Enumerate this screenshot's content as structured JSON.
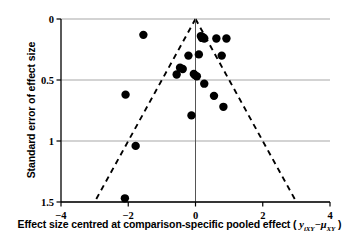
{
  "chart_data": {
    "type": "scatter",
    "title": "",
    "subtitle": "",
    "xlabel_plain": "Effect size centred at comparison-specific pooled effect ( y iXY − μ XY )",
    "xlabel_prefix": "Effect size centred at comparison-specific pooled effect ( ",
    "xlabel_var1": "y",
    "xlabel_sub1": "iXY",
    "xlabel_minus": "−",
    "xlabel_var2": "μ",
    "xlabel_sub2": "XY",
    "xlabel_suffix": " )",
    "ylabel": "Standard error of effect size",
    "xlim": [
      -4,
      4
    ],
    "ylim": [
      0,
      1.5
    ],
    "y_inverted": true,
    "xticks": [
      -4,
      -2,
      0,
      2,
      4
    ],
    "xticklabels": [
      "−4",
      "−2",
      "0",
      "2",
      "4"
    ],
    "yticks": [
      0,
      0.5,
      1,
      1.5
    ],
    "yticklabels": [
      "0",
      "0.5",
      "1",
      "1.5"
    ],
    "grid": "horizontal",
    "grid_color": "#a8a8a8",
    "legend": "none",
    "marker_color": "#000000",
    "marker_size": 4.2,
    "reference_line": {
      "name": "pooled-effect-vertical-line",
      "x": 0,
      "style": "solid",
      "color": "#555555"
    },
    "funnel_lines": {
      "name": "pseudo-95-percent-confidence-limits",
      "style": "dashed",
      "color": "#000000",
      "apex": [
        0,
        0
      ],
      "left_end": [
        -3.0,
        1.5
      ],
      "right_end": [
        3.0,
        1.5
      ]
    },
    "points": [
      {
        "x": -1.55,
        "y": 0.13
      },
      {
        "x": 0.16,
        "y": 0.14
      },
      {
        "x": 0.22,
        "y": 0.15
      },
      {
        "x": 0.19,
        "y": 0.155
      },
      {
        "x": 0.26,
        "y": 0.16
      },
      {
        "x": 0.62,
        "y": 0.16
      },
      {
        "x": 0.92,
        "y": 0.16
      },
      {
        "x": 0.1,
        "y": 0.29
      },
      {
        "x": -0.21,
        "y": 0.3
      },
      {
        "x": 0.78,
        "y": 0.3
      },
      {
        "x": -0.46,
        "y": 0.4
      },
      {
        "x": -0.38,
        "y": 0.41
      },
      {
        "x": -0.05,
        "y": 0.45
      },
      {
        "x": -0.02,
        "y": 0.46
      },
      {
        "x": -0.56,
        "y": 0.455
      },
      {
        "x": 0.04,
        "y": 0.47
      },
      {
        "x": 0.26,
        "y": 0.53
      },
      {
        "x": -2.08,
        "y": 0.62
      },
      {
        "x": 0.55,
        "y": 0.63
      },
      {
        "x": 0.83,
        "y": 0.72
      },
      {
        "x": -0.12,
        "y": 0.79
      },
      {
        "x": -1.78,
        "y": 1.04
      },
      {
        "x": -2.1,
        "y": 1.47
      }
    ]
  }
}
